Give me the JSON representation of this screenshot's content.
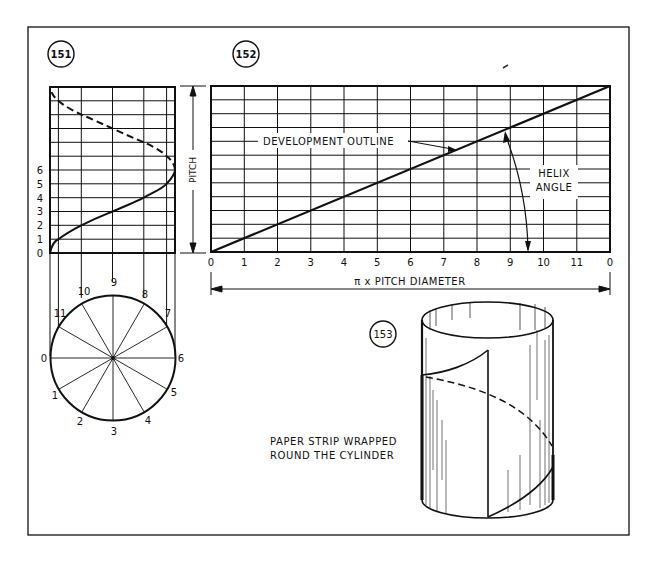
{
  "figures": {
    "fig151": {
      "number": "151"
    },
    "fig152": {
      "number": "152"
    },
    "fig153": {
      "number": "153"
    }
  },
  "fig151": {
    "height_labels": [
      "0",
      "1",
      "2",
      "3",
      "4",
      "5",
      "6"
    ],
    "circle_labels": [
      "0",
      "1",
      "2",
      "3",
      "4",
      "5",
      "6",
      "7",
      "8",
      "9",
      "10",
      "11"
    ]
  },
  "fig152": {
    "pitch_label": "PITCH",
    "x_labels": [
      "0",
      "1",
      "2",
      "3",
      "4",
      "5",
      "6",
      "7",
      "8",
      "9",
      "10",
      "11",
      "0"
    ],
    "dimension_label": "π x PITCH DIAMETER",
    "development_outline_label": "DEVELOPMENT OUTLINE",
    "helix_angle_label_line1": "HELIX",
    "helix_angle_label_line2": "ANGLE"
  },
  "fig153": {
    "caption_line1": "PAPER STRIP WRAPPED",
    "caption_line2": "ROUND THE CYLINDER"
  },
  "colors": {
    "ink": "#111111",
    "paper": "#ffffff"
  }
}
